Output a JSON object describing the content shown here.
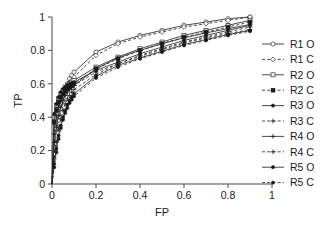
{
  "chart_data": {
    "type": "line",
    "title": "",
    "xlabel": "FP",
    "ylabel": "TP",
    "xlim": [
      0,
      1
    ],
    "ylim": [
      0,
      1
    ],
    "xticks": [
      "0",
      "0.2",
      "0.4",
      "0.6",
      "0.8",
      "1"
    ],
    "xtick_values": [
      0,
      0.2,
      0.4,
      0.6,
      0.8,
      1
    ],
    "yticks": [
      "0",
      "0.2",
      "0.4",
      "0.6",
      "0.8",
      "1"
    ],
    "ytick_values": [
      0,
      0.2,
      0.4,
      0.6,
      0.8,
      1
    ],
    "grid": false,
    "legend_position": "right",
    "x": [
      0.01,
      0.02,
      0.03,
      0.04,
      0.05,
      0.06,
      0.07,
      0.08,
      0.09,
      0.1,
      0.2,
      0.3,
      0.4,
      0.5,
      0.6,
      0.7,
      0.8,
      0.9
    ],
    "series": [
      {
        "name": "R1 O",
        "marker": "open-circle",
        "linestyle": "solid",
        "values": [
          0.22,
          0.33,
          0.42,
          0.48,
          0.53,
          0.57,
          0.6,
          0.63,
          0.65,
          0.67,
          0.79,
          0.85,
          0.89,
          0.92,
          0.95,
          0.97,
          0.99,
          1.0
        ]
      },
      {
        "name": "R1 C",
        "marker": "open-diamond",
        "linestyle": "dashed",
        "values": [
          0.18,
          0.29,
          0.38,
          0.45,
          0.5,
          0.54,
          0.57,
          0.6,
          0.62,
          0.64,
          0.77,
          0.84,
          0.88,
          0.91,
          0.94,
          0.96,
          0.98,
          1.0
        ]
      },
      {
        "name": "R2 O",
        "marker": "open-square",
        "linestyle": "solid",
        "values": [
          0.4,
          0.47,
          0.51,
          0.54,
          0.56,
          0.58,
          0.59,
          0.6,
          0.61,
          0.62,
          0.7,
          0.76,
          0.81,
          0.85,
          0.89,
          0.92,
          0.95,
          0.98
        ]
      },
      {
        "name": "R2 C",
        "marker": "filled-square",
        "linestyle": "dashed",
        "values": [
          0.37,
          0.44,
          0.49,
          0.52,
          0.54,
          0.56,
          0.57,
          0.58,
          0.59,
          0.6,
          0.69,
          0.75,
          0.8,
          0.84,
          0.88,
          0.91,
          0.94,
          0.97
        ]
      },
      {
        "name": "R3 O",
        "marker": "filled-dot",
        "linestyle": "solid",
        "values": [
          0.42,
          0.48,
          0.52,
          0.55,
          0.57,
          0.58,
          0.59,
          0.6,
          0.605,
          0.61,
          0.68,
          0.73,
          0.78,
          0.82,
          0.86,
          0.89,
          0.92,
          0.95
        ]
      },
      {
        "name": "R3 C",
        "marker": "plus",
        "linestyle": "dashed",
        "values": [
          0.3,
          0.4,
          0.46,
          0.5,
          0.53,
          0.55,
          0.565,
          0.575,
          0.585,
          0.59,
          0.67,
          0.72,
          0.77,
          0.81,
          0.85,
          0.88,
          0.91,
          0.94
        ]
      },
      {
        "name": "R4 O",
        "marker": "plus",
        "linestyle": "solid",
        "values": [
          0.25,
          0.34,
          0.41,
          0.46,
          0.5,
          0.53,
          0.55,
          0.565,
          0.58,
          0.59,
          0.69,
          0.755,
          0.8,
          0.84,
          0.875,
          0.905,
          0.93,
          0.955
        ]
      },
      {
        "name": "R4 C",
        "marker": "plus",
        "linestyle": "dashed",
        "values": [
          0.15,
          0.25,
          0.33,
          0.39,
          0.44,
          0.48,
          0.51,
          0.53,
          0.55,
          0.565,
          0.655,
          0.72,
          0.765,
          0.805,
          0.845,
          0.875,
          0.9,
          0.925
        ]
      },
      {
        "name": "R5 O",
        "marker": "filled-dot",
        "linestyle": "solid",
        "values": [
          0.12,
          0.21,
          0.29,
          0.35,
          0.4,
          0.44,
          0.475,
          0.5,
          0.52,
          0.54,
          0.645,
          0.71,
          0.755,
          0.795,
          0.835,
          0.865,
          0.895,
          0.92
        ]
      },
      {
        "name": "R5 C",
        "marker": "filled-dot",
        "linestyle": "dashed",
        "values": [
          0.1,
          0.19,
          0.27,
          0.335,
          0.385,
          0.425,
          0.455,
          0.485,
          0.505,
          0.525,
          0.635,
          0.7,
          0.75,
          0.79,
          0.83,
          0.86,
          0.89,
          0.915
        ]
      }
    ]
  },
  "colors": {
    "line": "#2b2b2b",
    "axis": "#4a4a4a",
    "text": "#1a1a1a",
    "background": "#ffffff"
  }
}
